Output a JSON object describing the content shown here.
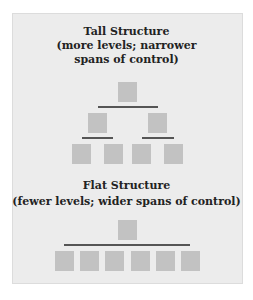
{
  "tall": {
    "title": "Tall Structure",
    "subtitle_1": "(more levels; narrower",
    "subtitle_2": "spans of control)"
  },
  "flat": {
    "title": "Flat Structure",
    "subtitle": "(fewer levels; wider spans of control)"
  },
  "colors": {
    "background": "#ececec",
    "box": "#c2c2c2",
    "connector": "#555555",
    "text": "#222222"
  },
  "diagram": {
    "tall_levels": [
      1,
      2,
      4
    ],
    "flat_levels": [
      1,
      6
    ]
  }
}
